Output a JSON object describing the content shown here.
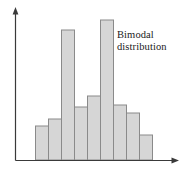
{
  "chart_data": {
    "type": "bar",
    "title": "",
    "subtitle": "",
    "xlabel": "",
    "ylabel": "",
    "categories": [
      "1",
      "2",
      "3",
      "4",
      "5",
      "6",
      "7",
      "8",
      "9"
    ],
    "values": [
      34,
      41,
      130,
      53,
      64,
      140,
      55,
      47,
      25
    ],
    "xlim": [
      0,
      9
    ],
    "ylim": [
      0,
      152
    ],
    "grid": false,
    "legend_position": "none",
    "bar_fill_color": "#d6d6d6",
    "bar_edge_color": "#8a8a8a",
    "axis_color": "#3a3a3a",
    "annotations": [
      {
        "name": "bimodal-distribution-label",
        "lines": [
          "Bimodal",
          "distribution"
        ],
        "x": 6.1,
        "y": 133,
        "color": "#1a1a1a"
      }
    ],
    "axes": {
      "y_axis": {
        "arrow": true,
        "ticks": [],
        "tick_labels": []
      },
      "x_axis": {
        "arrow": true,
        "ticks": [],
        "tick_labels": []
      }
    }
  },
  "annotation": {
    "line1": "Bimodal",
    "line2": "distribution"
  },
  "figure": {
    "background_color": "#ffffff"
  }
}
